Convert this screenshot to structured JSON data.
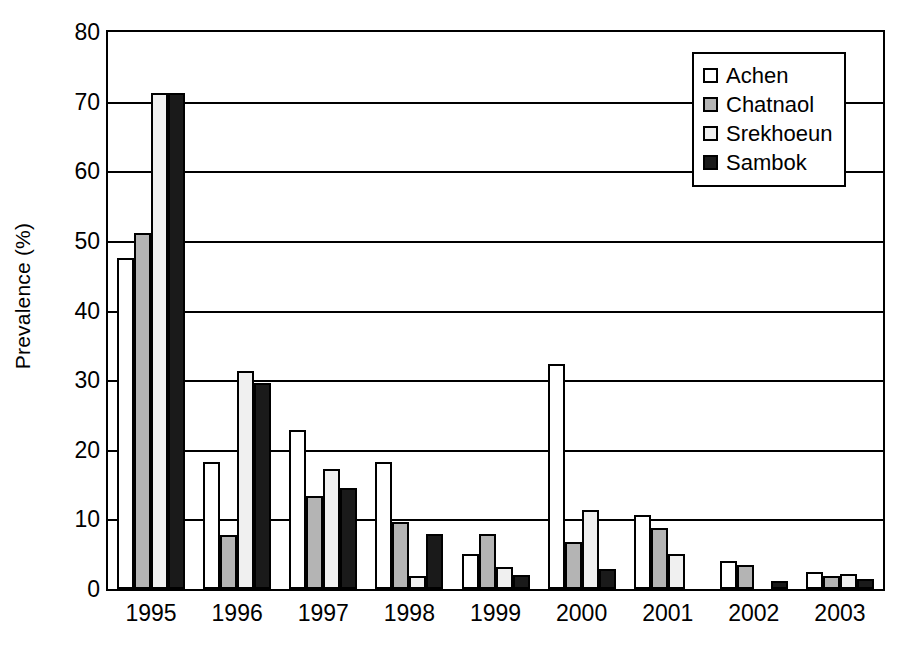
{
  "chart_data": {
    "type": "bar",
    "title": "",
    "xlabel": "",
    "ylabel": "Prevalence (%)",
    "ylim": [
      0,
      80
    ],
    "yticks": [
      0,
      10,
      20,
      30,
      40,
      50,
      60,
      70,
      80
    ],
    "grid": true,
    "legend_position": "top-right",
    "categories": [
      "1995",
      "1996",
      "1997",
      "1998",
      "1999",
      "2000",
      "2001",
      "2002",
      "2003"
    ],
    "series": [
      {
        "name": "Achen",
        "color": "#ffffff",
        "values": [
          47.5,
          18.3,
          22.8,
          18.3,
          5.0,
          32.3,
          10.7,
          4.0,
          2.4
        ]
      },
      {
        "name": "Chatnaol",
        "color": "#b4b4b4",
        "values": [
          51.2,
          7.7,
          13.3,
          9.6,
          7.9,
          6.7,
          8.8,
          3.4,
          1.9
        ]
      },
      {
        "name": "Srekhoeun",
        "color": "#f0f0f0",
        "values": [
          71.3,
          31.3,
          17.2,
          1.8,
          3.2,
          11.4,
          5.0,
          0.0,
          2.1
        ]
      },
      {
        "name": "Sambok",
        "color": "#1a1a1a",
        "values": [
          71.3,
          29.6,
          14.5,
          7.9,
          2.0,
          2.9,
          0.0,
          1.2,
          1.4
        ]
      }
    ]
  },
  "axis": {
    "y_title": "Prevalence (%)",
    "y_tick_labels": [
      "80",
      "70",
      "60",
      "50",
      "40",
      "30",
      "20",
      "10",
      "0"
    ],
    "x_tick_labels": [
      "1995",
      "1996",
      "1997",
      "1998",
      "1999",
      "2000",
      "2001",
      "2002",
      "2003"
    ]
  },
  "legend": {
    "entries": [
      {
        "label": "Achen"
      },
      {
        "label": "Chatnaol"
      },
      {
        "label": "Srekhoeun"
      },
      {
        "label": "Sambok"
      }
    ]
  }
}
